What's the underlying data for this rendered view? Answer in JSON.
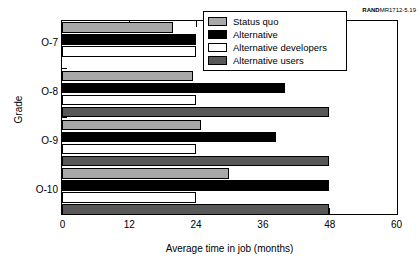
{
  "credit": {
    "brand": "RAND",
    "code": "MR1712-5.19"
  },
  "chart_data": {
    "type": "bar",
    "orientation": "horizontal",
    "title": "",
    "xlabel": "Average time in job (months)",
    "ylabel": "Grade",
    "categories": [
      "O-7",
      "O-8",
      "O-9",
      "O-10"
    ],
    "xlim": [
      0,
      60
    ],
    "xticks": [
      0,
      12,
      24,
      36,
      48,
      60
    ],
    "xtick_labels": [
      "0",
      "12",
      "24",
      "36",
      "48",
      "60"
    ],
    "grid": false,
    "legend_position": "top-right",
    "series": [
      {
        "name": "Status quo",
        "color": "#a8a8a8",
        "values": [
          20,
          23.5,
          25,
          30
        ]
      },
      {
        "name": "Alternative",
        "color": "#000000",
        "values": [
          24,
          40,
          38.5,
          48
        ]
      },
      {
        "name": "Alternative developers",
        "color": "#ffffff",
        "values": [
          24,
          24,
          24,
          24
        ]
      },
      {
        "name": "Alternative users",
        "color": "#585858",
        "values": [
          0,
          48,
          48,
          48
        ]
      }
    ]
  }
}
